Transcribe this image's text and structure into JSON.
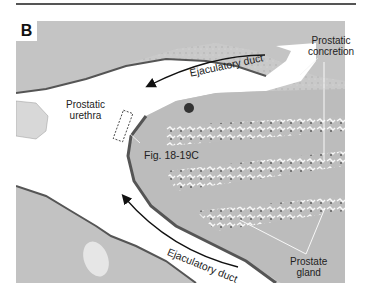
{
  "figure": {
    "panel_label": "B",
    "labels": {
      "ejaculatory_duct_top": "Ejaculatory duct",
      "ejaculatory_duct_bottom": "Ejaculatory duct",
      "prostatic_urethra_line1": "Prostatic",
      "prostatic_urethra_line2": "urethra",
      "fig_reference": "Fig. 18-19C",
      "prostatic_concretion_line1": "Prostatic",
      "prostatic_concretion_line2": "concretion",
      "prostate_gland_line1": "Prostate",
      "prostate_gland_line2": "gland"
    },
    "image_description": "Grayscale histology micrograph of prostatic urethra with ejaculatory ducts and prostate glands"
  }
}
